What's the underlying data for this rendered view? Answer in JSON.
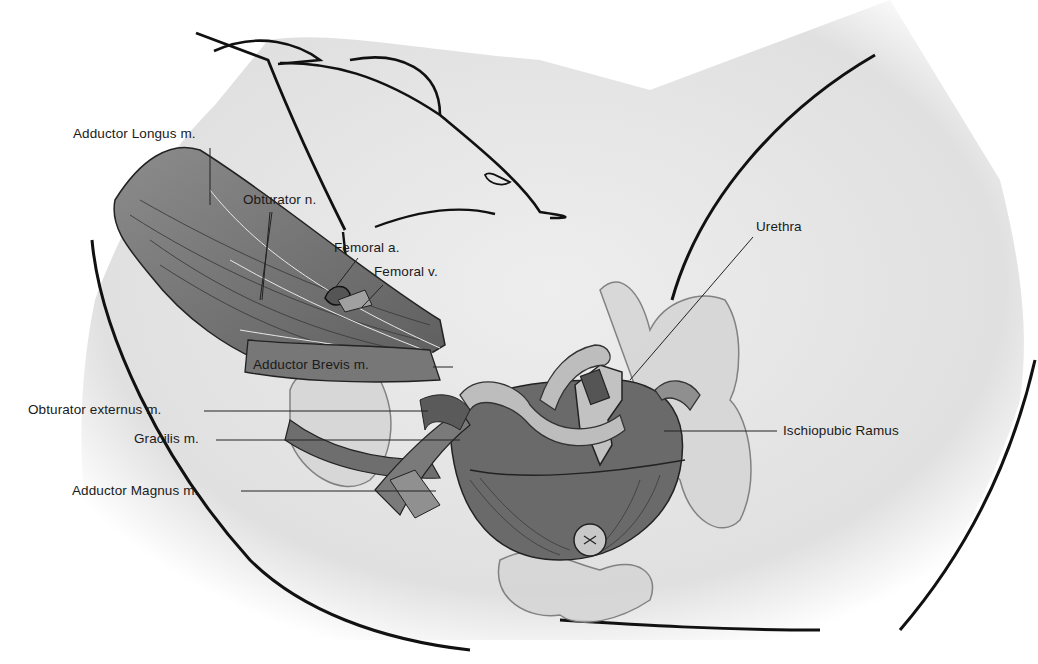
{
  "figure": {
    "labels": {
      "adductor_longus": "Adductor Longus m.",
      "obturator_n": "Obturator n.",
      "femoral_a": "Femoral a.",
      "femoral_v": "Femoral v.",
      "adductor_brevis": "Adductor Brevis m.",
      "obturator_externus": "Obturator externus m.",
      "gracilis": "Gracilis m.",
      "adductor_magnus": "Adductor Magnus m.",
      "urethra": "Urethra",
      "ischiopubic_ramus": "Ischiopubic Ramus"
    },
    "colors": {
      "skin": "#e6e6e6",
      "muscle_dark": "#6e6e6e",
      "muscle_mid": "#8a8a8a",
      "bone": "#d2d2d2",
      "outline": "#111111"
    }
  }
}
